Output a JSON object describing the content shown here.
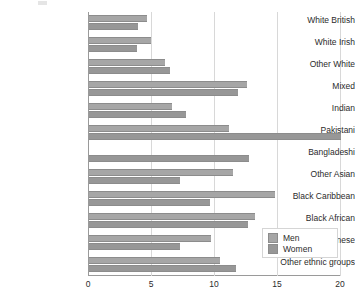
{
  "chart_data": {
    "type": "bar",
    "orientation": "horizontal",
    "title": "",
    "subtitle": "",
    "xlabel": "",
    "ylabel": "",
    "xlim": [
      0,
      20
    ],
    "xticks": [
      0,
      5,
      10,
      15,
      20
    ],
    "xtick_labels": [
      "0",
      "5",
      "10",
      "15",
      "20"
    ],
    "grid": true,
    "grid_axis": "x",
    "legend_position": "bottom-right",
    "categories": [
      "White British",
      "White Irish",
      "Other White",
      "Mixed",
      "Indian",
      "Pakistani",
      "Bangladeshi",
      "Other Asian",
      "Black Caribbean",
      "Black African",
      "Chinese",
      "Other ethnic groups"
    ],
    "series": [
      {
        "name": "Men",
        "color": "#a6a6a6",
        "values": [
          4.6,
          4.9,
          6.0,
          12.5,
          6.6,
          11.1,
          0.0,
          11.4,
          14.8,
          13.2,
          9.7,
          10.4
        ]
      },
      {
        "name": "Women",
        "color": "#979797",
        "values": [
          3.9,
          3.8,
          6.4,
          11.8,
          7.7,
          20.0,
          12.7,
          7.2,
          9.6,
          12.6,
          7.2,
          11.7
        ]
      }
    ]
  },
  "legend": {
    "entries": [
      {
        "label": "Men",
        "color": "#a6a6a6"
      },
      {
        "label": "Women",
        "color": "#979797"
      }
    ]
  },
  "colors": {
    "men": "#a6a6a6",
    "women": "#979797",
    "grid": "#d8d8d8",
    "axis": "#9a9a9a",
    "text": "#2b2b2b",
    "background": "#ffffff"
  }
}
